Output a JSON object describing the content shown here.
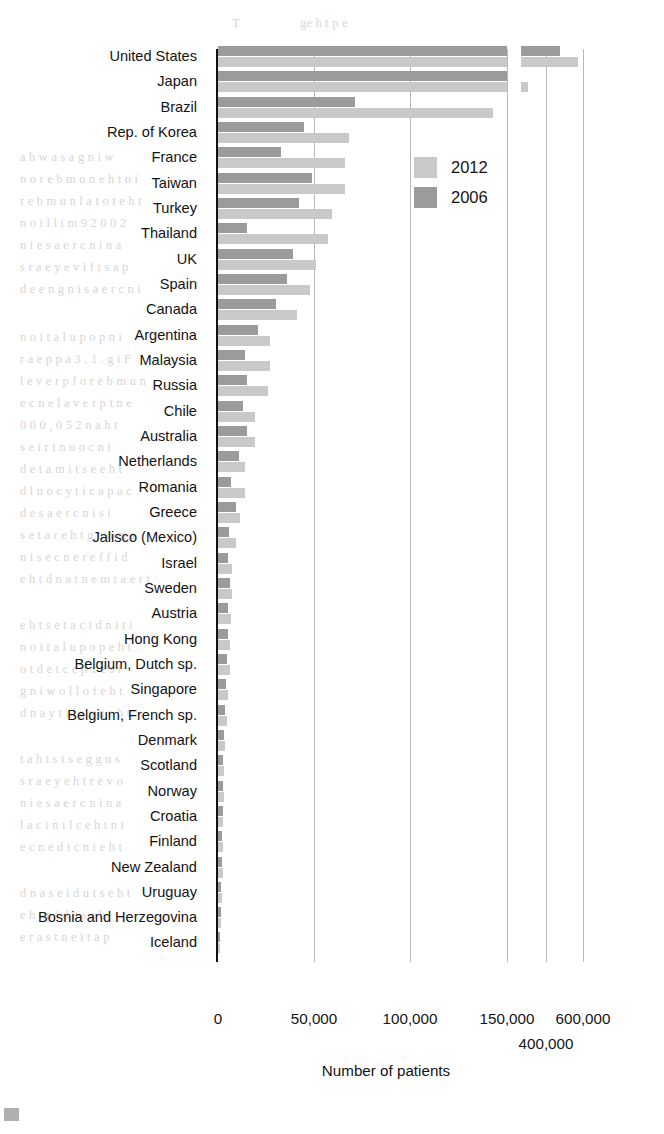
{
  "chart_data": {
    "type": "bar",
    "orientation": "horizontal",
    "title": "",
    "xlabel": "Number of patients",
    "ylabel": "",
    "grid": true,
    "legend_position": "inside-upper-right",
    "broken_axis": true,
    "axis_segments": [
      {
        "name": "main",
        "data_min": 0,
        "data_max": 150000,
        "px_min": 218,
        "px_max": 507
      },
      {
        "name": "upper",
        "data_min": 350000,
        "data_max": 650000,
        "px_min": 521,
        "px_max": 601
      }
    ],
    "xticks": [
      {
        "label": "0",
        "value": 0,
        "x": 218,
        "row": 1
      },
      {
        "label": "50,000",
        "value": 50000,
        "x": 314,
        "row": 1
      },
      {
        "label": "100,000",
        "value": 100000,
        "x": 410,
        "row": 1
      },
      {
        "label": "150,000",
        "value": 150000,
        "x": 507,
        "row": 1
      },
      {
        "label": "400,000",
        "value": 400000,
        "x": 546,
        "row": 2
      },
      {
        "label": "600,000",
        "value": 600000,
        "x": 583,
        "row": 1
      }
    ],
    "gridlines_x": [
      314,
      410,
      507,
      546,
      583
    ],
    "series": [
      {
        "name": "2012",
        "color": "#c9c9c9"
      },
      {
        "name": "2006",
        "color": "#9b9b9b"
      }
    ],
    "categories": [
      "United States",
      "Japan",
      "Brazil",
      "Rep. of Korea",
      "France",
      "Taiwan",
      "Turkey",
      "Thailand",
      "UK",
      "Spain",
      "Canada",
      "Argentina",
      "Malaysia",
      "Russia",
      "Chile",
      "Australia",
      "Netherlands",
      "Romania",
      "Greece",
      "Jalisco (Mexico)",
      "Israel",
      "Sweden",
      "Austria",
      "Hong Kong",
      "Belgium, Dutch sp.",
      "Singapore",
      "Belgium, French sp.",
      "Denmark",
      "Scotland",
      "Norway",
      "Croatia",
      "Finland",
      "New Zealand",
      "Uruguay",
      "Bosnia and Herzegovina",
      "Iceland"
    ],
    "rows": [
      {
        "label": "United States",
        "v2006": 485000,
        "v2012": 585000,
        "px2006": 289,
        "px2012": 289,
        "rp2006": 39,
        "rp2012": 57
      },
      {
        "label": "Japan",
        "v2006": 264000,
        "v2012": 396000,
        "px2006": 289,
        "px2012": 289,
        "rp2006": 0,
        "rp2012": 7
      },
      {
        "label": "Brazil",
        "v2006": 71000,
        "v2012": 143000,
        "px2006": 137,
        "px2012": 275,
        "rp2006": 0,
        "rp2012": 0
      },
      {
        "label": "Rep. of Korea",
        "v2006": 45000,
        "v2012": 68000,
        "px2006": 86,
        "px2012": 131,
        "rp2006": 0,
        "rp2012": 0
      },
      {
        "label": "France",
        "v2006": 33000,
        "v2012": 66000,
        "px2006": 63,
        "px2012": 127,
        "rp2006": 0,
        "rp2012": 0
      },
      {
        "label": "Taiwan",
        "v2006": 49000,
        "v2012": 66000,
        "px2006": 94,
        "px2012": 127,
        "rp2006": 0,
        "rp2012": 0
      },
      {
        "label": "Turkey",
        "v2006": 42000,
        "v2012": 59000,
        "px2006": 81,
        "px2012": 114,
        "rp2006": 0,
        "rp2012": 0
      },
      {
        "label": "Thailand",
        "v2006": 15000,
        "v2012": 57000,
        "px2006": 29,
        "px2012": 110,
        "rp2006": 0,
        "rp2012": 0
      },
      {
        "label": "UK",
        "v2006": 39000,
        "v2012": 51000,
        "px2006": 75,
        "px2012": 98,
        "rp2006": 0,
        "rp2012": 0
      },
      {
        "label": "Spain",
        "v2006": 36000,
        "v2012": 48000,
        "px2006": 69,
        "px2012": 92,
        "rp2006": 0,
        "rp2012": 0
      },
      {
        "label": "Canada",
        "v2006": 30000,
        "v2012": 41000,
        "px2006": 58,
        "px2012": 79,
        "rp2006": 0,
        "rp2012": 0
      },
      {
        "label": "Argentina",
        "v2006": 21000,
        "v2012": 27000,
        "px2006": 40,
        "px2012": 52,
        "rp2006": 0,
        "rp2012": 0
      },
      {
        "label": "Malaysia",
        "v2006": 14000,
        "v2012": 27000,
        "px2006": 27,
        "px2012": 52,
        "rp2006": 0,
        "rp2012": 0
      },
      {
        "label": "Russia",
        "v2006": 15000,
        "v2012": 26000,
        "px2006": 29,
        "px2012": 50,
        "rp2006": 0,
        "rp2012": 0
      },
      {
        "label": "Chile",
        "v2006": 13000,
        "v2012": 19000,
        "px2006": 25,
        "px2012": 37,
        "rp2006": 0,
        "rp2012": 0
      },
      {
        "label": "Australia",
        "v2006": 15000,
        "v2012": 19000,
        "px2006": 29,
        "px2012": 37,
        "rp2006": 0,
        "rp2012": 0
      },
      {
        "label": "Netherlands",
        "v2006": 11000,
        "v2012": 14000,
        "px2006": 21,
        "px2012": 27,
        "rp2006": 0,
        "rp2012": 0
      },
      {
        "label": "Romania",
        "v2006": 6500,
        "v2012": 14000,
        "px2006": 13,
        "px2012": 27,
        "rp2006": 0,
        "rp2012": 0
      },
      {
        "label": "Greece",
        "v2006": 9500,
        "v2012": 11500,
        "px2006": 18,
        "px2012": 22,
        "rp2006": 0,
        "rp2012": 0
      },
      {
        "label": "Jalisco (Mexico)",
        "v2006": 5500,
        "v2012": 9500,
        "px2006": 11,
        "px2012": 18,
        "rp2006": 0,
        "rp2012": 0
      },
      {
        "label": "Israel",
        "v2006": 5000,
        "v2012": 7500,
        "px2006": 10,
        "px2012": 14,
        "rp2006": 0,
        "rp2012": 0
      },
      {
        "label": "Sweden",
        "v2006": 6000,
        "v2012": 7000,
        "px2006": 12,
        "px2012": 14,
        "rp2006": 0,
        "rp2012": 0
      },
      {
        "label": "Austria",
        "v2006": 5000,
        "v2012": 6500,
        "px2006": 10,
        "px2012": 13,
        "rp2006": 0,
        "rp2012": 0
      },
      {
        "label": "Hong Kong",
        "v2006": 5000,
        "v2012": 6000,
        "px2006": 10,
        "px2012": 12,
        "rp2006": 0,
        "rp2012": 0
      },
      {
        "label": "Belgium, Dutch sp.",
        "v2006": 4500,
        "v2012": 6000,
        "px2006": 9,
        "px2012": 12,
        "rp2006": 0,
        "rp2012": 0
      },
      {
        "label": "Singapore",
        "v2006": 3800,
        "v2012": 5200,
        "px2006": 8,
        "px2012": 10,
        "rp2006": 0,
        "rp2012": 0
      },
      {
        "label": "Belgium, French sp.",
        "v2006": 3400,
        "v2012": 4500,
        "px2006": 7,
        "px2012": 9,
        "rp2006": 0,
        "rp2012": 0
      },
      {
        "label": "Denmark",
        "v2006": 2800,
        "v2012": 3400,
        "px2006": 6,
        "px2012": 7,
        "rp2006": 0,
        "rp2012": 0
      },
      {
        "label": "Scotland",
        "v2006": 2600,
        "v2012": 3100,
        "px2006": 5,
        "px2012": 6,
        "rp2006": 0,
        "rp2012": 0
      },
      {
        "label": "Norway",
        "v2006": 2200,
        "v2012": 2800,
        "px2006": 5,
        "px2012": 6,
        "rp2006": 0,
        "rp2012": 0
      },
      {
        "label": "Croatia",
        "v2006": 2200,
        "v2012": 2600,
        "px2006": 5,
        "px2012": 5,
        "rp2006": 0,
        "rp2012": 0
      },
      {
        "label": "Finland",
        "v2006": 1900,
        "v2012": 2300,
        "px2006": 4,
        "px2012": 5,
        "rp2006": 0,
        "rp2012": 0
      },
      {
        "label": "New Zealand",
        "v2006": 1900,
        "v2012": 2300,
        "px2006": 4,
        "px2012": 5,
        "rp2006": 0,
        "rp2012": 0
      },
      {
        "label": "Uruguay",
        "v2006": 1400,
        "v2012": 1700,
        "px2006": 3,
        "px2012": 4,
        "rp2006": 0,
        "rp2012": 0
      },
      {
        "label": "Bosnia and Herzegovina",
        "v2006": 1200,
        "v2012": 1500,
        "px2006": 3,
        "px2012": 3,
        "rp2006": 0,
        "rp2012": 0
      },
      {
        "label": "Iceland",
        "v2006": 170,
        "v2012": 220,
        "px2006": 2,
        "px2012": 2,
        "rp2006": 0,
        "rp2012": 0
      }
    ],
    "colors": {
      "series_2012": "#c9c9c9",
      "series_2006": "#9b9b9b",
      "grid": "#b9b9b9",
      "axis": "#111111"
    }
  },
  "legend": {
    "items": [
      {
        "label": "2012",
        "color": "#c9c9c9"
      },
      {
        "label": "2006",
        "color": "#9b9b9b"
      }
    ]
  },
  "axis": {
    "xlabel": "Number of patients"
  },
  "ghost_text": [
    {
      "x": 232,
      "y": 16,
      "t": "T"
    },
    {
      "x": 300,
      "y": 16,
      "t": "ge  h  t                 p  e "
    },
    {
      "x": 20,
      "y": 150,
      "t": "a  h  w  a  s  a       g  n  i  w"
    },
    {
      "x": 20,
      "y": 172,
      "t": "n  o   r  e  b  m  u  n     e  h  t     n  i"
    },
    {
      "x": 20,
      "y": 194,
      "t": "r  e  b  m  u  n     l  a  t  o  t     e  h  t"
    },
    {
      "x": 20,
      "y": 216,
      "t": "n  o  i  l  l  i  m   9  2  0  0  2"
    },
    {
      "x": 20,
      "y": 238,
      "t": "n  i     e  s  a  e  r  c  n  i     n  a"
    },
    {
      "x": 20,
      "y": 260,
      "t": "s  r  a  e  y     e  v  i  f     t  s  a  p"
    },
    {
      "x": 20,
      "y": 282,
      "t": "d  e  e  n     g  n  i  s  a  e  r  c  n  i"
    },
    {
      "x": 20,
      "y": 330,
      "t": "n  o  i  t  a  l  u  p  o  p     n  i"
    },
    {
      "x": 20,
      "y": 352,
      "t": "r  a  e  p  p  a   3  .  1   .  g  i  F"
    },
    {
      "x": 20,
      "y": 374,
      "t": "l  e  v  e  r  p     f  o     r  e  b  m  u  n"
    },
    {
      "x": 20,
      "y": 396,
      "t": "e  c  n  e  l  a  v  e  r  p     t  n  e"
    },
    {
      "x": 20,
      "y": 418,
      "t": "0  0  0  ,  0  5  2   n  a  h  t"
    },
    {
      "x": 20,
      "y": 440,
      "t": "s  e  i  r  t  n  u  o  c     n  i"
    },
    {
      "x": 20,
      "y": 462,
      "t": "d  e  t  a  m  i  t  s  e     e  h  t"
    },
    {
      "x": 20,
      "y": 484,
      "t": "d  l  u  o  c     y  t  i  c  a  p  a  c"
    },
    {
      "x": 20,
      "y": 506,
      "t": "d  e  s  a  e  r  c  n  i     s  i"
    },
    {
      "x": 20,
      "y": 528,
      "t": "s  e  t  a  r     e  h  t     g  n  o  m  a"
    },
    {
      "x": 20,
      "y": 550,
      "t": "n  i     s  e  c  n  e  r  e  f  f  i  d"
    },
    {
      "x": 20,
      "y": 572,
      "t": "e  h  t     d  n  a     t  n  e  m  t  a  e  r  t"
    },
    {
      "x": 20,
      "y": 618,
      "t": "e  h  t     s  e  t  a  c  i  d  n  i     t  i"
    },
    {
      "x": 20,
      "y": 640,
      "t": "n  o  i  t  a  l  u  p  o  p     e  h  t"
    },
    {
      "x": 20,
      "y": 662,
      "t": "o  t     d  e  t  c  e  p  x  e     s  i"
    },
    {
      "x": 20,
      "y": 684,
      "t": "g  n  i  w  o  l  l  o  f     e  h  t"
    },
    {
      "x": 20,
      "y": 706,
      "t": "d  n  a     y  t  i  l  a  u  q     e  h  t"
    },
    {
      "x": 20,
      "y": 752,
      "t": "t  a  h  t     s  t  s  e  g  g  u  s"
    },
    {
      "x": 20,
      "y": 774,
      "t": "s  r  a  e  y     e  h  t     r  e  v  o"
    },
    {
      "x": 20,
      "y": 796,
      "t": "n  i     e  s  a  e  r  c  n  i     n  a"
    },
    {
      "x": 20,
      "y": 818,
      "t": "l  a  c  i  n  i  l  c     e  h  t     n  i"
    },
    {
      "x": 20,
      "y": 840,
      "t": "e  c  n  e  d  i  c  n  i     e  h  t"
    },
    {
      "x": 20,
      "y": 886,
      "t": "d  n  a     s  e  i  d  u  t  s     e  h  t"
    },
    {
      "x": 20,
      "y": 908,
      "t": "e  h  t     n  i     d  e  s  a  b"
    },
    {
      "x": 20,
      "y": 930,
      "t": "e  r  a     s  t  n  e  i  t  a  p"
    }
  ]
}
